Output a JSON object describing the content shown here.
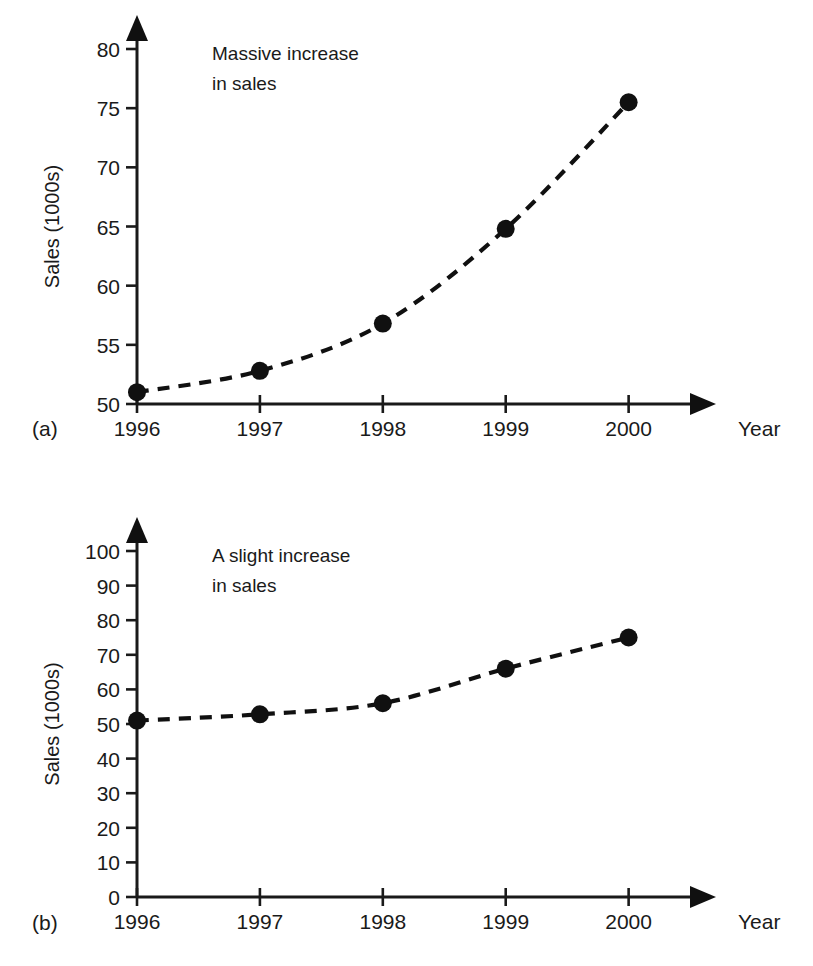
{
  "page": {
    "partial_top_text": "",
    "background": "#ffffff",
    "ink_color": "#101010"
  },
  "figures": [
    {
      "id": "a",
      "sublabel": "(a)",
      "annotation": [
        "Massive increase",
        "in sales"
      ],
      "ylabel": "Sales (1000s)",
      "xlabel": "Year",
      "yticks": [
        50,
        55,
        60,
        65,
        70,
        75,
        80
      ],
      "ytick_labels": [
        "50",
        "55",
        "60",
        "65",
        "70",
        "75",
        "80"
      ],
      "xtick_labels": [
        "1996",
        "1997",
        "1998",
        "1999",
        "2000"
      ]
    },
    {
      "id": "b",
      "sublabel": "(b)",
      "annotation": [
        "A slight increase",
        "in sales"
      ],
      "ylabel": "Sales (1000s)",
      "xlabel": "Year",
      "yticks": [
        0,
        10,
        20,
        30,
        40,
        50,
        60,
        70,
        80,
        90,
        100
      ],
      "ytick_labels": [
        "0",
        "10",
        "20",
        "30",
        "40",
        "50",
        "60",
        "70",
        "80",
        "90",
        "100"
      ],
      "xtick_labels": [
        "1996",
        "1997",
        "1998",
        "1999",
        "2000"
      ]
    }
  ],
  "chart_data": [
    {
      "type": "line",
      "title": "",
      "subfigure": "(a)",
      "annotation": "Massive increase in sales",
      "xlabel": "Year",
      "ylabel": "Sales (1000s)",
      "categories": [
        "1996",
        "1997",
        "1998",
        "1999",
        "2000"
      ],
      "x": [
        1996,
        1997,
        1998,
        1999,
        2000
      ],
      "values": [
        51.0,
        52.8,
        56.8,
        64.8,
        75.5
      ],
      "series": [
        {
          "name": "Sales",
          "values": [
            51.0,
            52.8,
            56.8,
            64.8,
            75.5
          ],
          "linestyle": "dashed",
          "marker": "filled-circle",
          "color": "#101010"
        }
      ],
      "ylim": [
        50,
        80
      ],
      "yticks": [
        50,
        55,
        60,
        65,
        70,
        75,
        80
      ],
      "xlim": [
        1996,
        2000
      ],
      "grid": false,
      "legend": false
    },
    {
      "type": "line",
      "title": "",
      "subfigure": "(b)",
      "annotation": "A slight increase in sales",
      "xlabel": "Year",
      "ylabel": "Sales (1000s)",
      "categories": [
        "1996",
        "1997",
        "1998",
        "1999",
        "2000"
      ],
      "x": [
        1996,
        1997,
        1998,
        1999,
        2000
      ],
      "values": [
        51.0,
        52.8,
        56.0,
        66.0,
        75.0
      ],
      "series": [
        {
          "name": "Sales",
          "values": [
            51.0,
            52.8,
            56.0,
            66.0,
            75.0
          ],
          "linestyle": "dashed",
          "marker": "filled-circle",
          "color": "#101010"
        }
      ],
      "ylim": [
        0,
        100
      ],
      "yticks": [
        0,
        10,
        20,
        30,
        40,
        50,
        60,
        70,
        80,
        90,
        100
      ],
      "xlim": [
        1996,
        2000
      ],
      "grid": false,
      "legend": false
    }
  ]
}
